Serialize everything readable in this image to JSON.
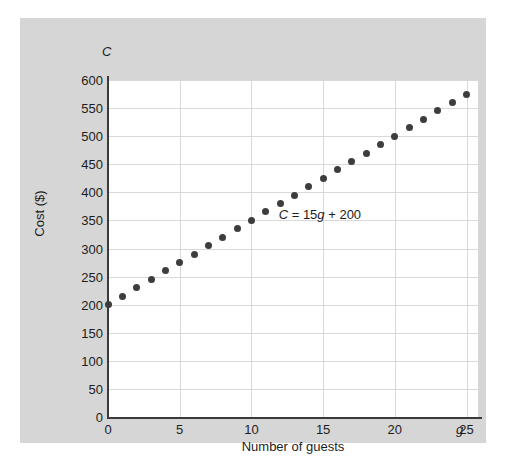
{
  "chart_data": {
    "type": "scatter",
    "title": "",
    "xlabel": "Number of guests",
    "ylabel": "Cost ($)",
    "x_symbol": "g",
    "y_symbol": "C",
    "annotation": "C = 15g + 200",
    "annotation_parts": {
      "y_var": "C",
      "equals": " = ",
      "slope": "15",
      "x_var": "g",
      "plus": " + ",
      "intercept": "200"
    },
    "equation": {
      "slope": 15,
      "intercept": 200
    },
    "xlim": [
      0,
      25.8
    ],
    "ylim": [
      0,
      600
    ],
    "xticks": [
      0,
      5,
      10,
      15,
      20,
      25
    ],
    "xtick_labels": [
      "0",
      "5",
      "10",
      "15",
      "20",
      "25"
    ],
    "yticks": [
      0,
      50,
      100,
      150,
      200,
      250,
      300,
      350,
      400,
      450,
      500,
      550,
      600
    ],
    "ytick_labels": [
      "0",
      "50",
      "100",
      "150",
      "200",
      "250",
      "300",
      "350",
      "400",
      "450",
      "500",
      "550",
      "600"
    ],
    "grid": true,
    "legend": "none",
    "x": [
      0,
      1,
      2,
      3,
      4,
      5,
      6,
      7,
      8,
      9,
      10,
      11,
      12,
      13,
      14,
      15,
      16,
      17,
      18,
      19,
      20,
      21,
      22,
      23,
      24,
      25
    ],
    "values": [
      200,
      215,
      230,
      245,
      260,
      275,
      290,
      305,
      320,
      335,
      350,
      365,
      380,
      395,
      410,
      425,
      440,
      455,
      470,
      485,
      500,
      515,
      530,
      545,
      560,
      575
    ],
    "marker_color": "#3d3d3d",
    "plot_background": "#ffffff",
    "panel_background": "#d6d6d6",
    "grid_color": "#d9d9d9",
    "axis_color": "#3a3a3a"
  }
}
